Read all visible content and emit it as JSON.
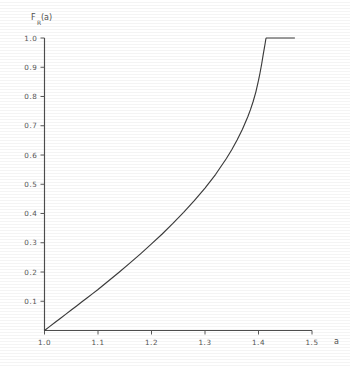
{
  "figure": {
    "background_color": "#ffffff",
    "line_color": "#3b3b3b",
    "axis_color": "#4d4d4d",
    "text_color": "#565656"
  },
  "chart_data": {
    "type": "line",
    "title": "",
    "subtitle": "",
    "xlabel": "a",
    "ylabel": "F_R(a)",
    "ylabel_base": "F",
    "ylabel_subscript": "R",
    "ylabel_argument": "(a)",
    "xlim": [
      1.0,
      1.5
    ],
    "ylim": [
      0.0,
      1.0
    ],
    "grid": false,
    "legend": null,
    "legend_position": "none",
    "xticks": [
      1.0,
      1.1,
      1.2,
      1.3,
      1.4,
      1.5
    ],
    "xtick_labels": [
      "1.0",
      "1.1",
      "1.2",
      "1.3",
      "1.4",
      "1.5"
    ],
    "yticks": [
      0.1,
      0.2,
      0.3,
      0.4,
      0.5,
      0.6,
      0.7,
      0.8,
      0.9,
      1.0
    ],
    "ytick_labels": [
      "0.1",
      "0.2",
      "0.3",
      "0.4",
      "0.5",
      "0.6",
      "0.7",
      "0.8",
      "0.9",
      "1.0"
    ],
    "series": [
      {
        "name": "F_R(a)",
        "color": "#3b3b3b",
        "saturation_x": 1.414,
        "saturation_y": 1.0,
        "draw_end_x": 1.468,
        "x": [
          1.0,
          1.01,
          1.02,
          1.03,
          1.04,
          1.05,
          1.06,
          1.07,
          1.08,
          1.09,
          1.1,
          1.12,
          1.14,
          1.16,
          1.18,
          1.2,
          1.22,
          1.24,
          1.26,
          1.28,
          1.3,
          1.32,
          1.34,
          1.35,
          1.36,
          1.37,
          1.38,
          1.385,
          1.39,
          1.395,
          1.4,
          1.403,
          1.406,
          1.409,
          1.411,
          1.412,
          1.413,
          1.4135,
          1.4142,
          1.43,
          1.45,
          1.468
        ],
        "y": [
          0.0,
          0.014,
          0.028,
          0.042,
          0.056,
          0.07,
          0.084,
          0.098,
          0.112,
          0.126,
          0.14,
          0.17,
          0.2,
          0.231,
          0.263,
          0.296,
          0.33,
          0.366,
          0.404,
          0.444,
          0.487,
          0.534,
          0.588,
          0.618,
          0.651,
          0.688,
          0.731,
          0.755,
          0.783,
          0.815,
          0.855,
          0.882,
          0.912,
          0.946,
          0.966,
          0.977,
          0.988,
          0.994,
          1.0,
          1.0,
          1.0,
          1.0
        ]
      }
    ]
  }
}
